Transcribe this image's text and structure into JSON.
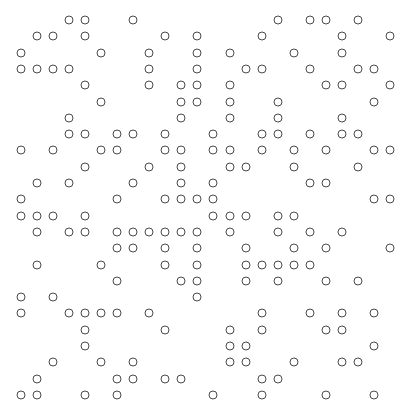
{
  "grid": {
    "columns": 24,
    "rows": 24,
    "origin_x": 21,
    "origin_y": 20,
    "col_pitch": 16.04,
    "row_pitch": 16.3,
    "stroke_color": "#4a4a4a",
    "fill_color": "#ffffff",
    "background": "#ffffff",
    "cells": [
      [
        3,
        4,
        7,
        16,
        18,
        19,
        21
      ],
      [
        1,
        2,
        4,
        9,
        11,
        15,
        20,
        23
      ],
      [
        0,
        5,
        8,
        11,
        13,
        17,
        20
      ],
      [
        0,
        1,
        2,
        3,
        8,
        11,
        14,
        15,
        18,
        21,
        22
      ],
      [
        4,
        8,
        10,
        11,
        13,
        19,
        20,
        23
      ],
      [
        5,
        10,
        11,
        13,
        16,
        22
      ],
      [
        3,
        10,
        13,
        16,
        20
      ],
      [
        3,
        4,
        6,
        7,
        9,
        12,
        15,
        16,
        18,
        20,
        21
      ],
      [
        0,
        2,
        5,
        6,
        9,
        10,
        12,
        13,
        15,
        17,
        19,
        22,
        23
      ],
      [
        4,
        8,
        10,
        13,
        14,
        17,
        21
      ],
      [
        1,
        3,
        7,
        10,
        12,
        18,
        19
      ],
      [
        0,
        6,
        9,
        10,
        11,
        12,
        22,
        23
      ],
      [
        0,
        1,
        2,
        4,
        12,
        13,
        14,
        16,
        17
      ],
      [
        1,
        3,
        4,
        6,
        7,
        8,
        9,
        10,
        11,
        13,
        16,
        18,
        20
      ],
      [
        6,
        7,
        9,
        11,
        14,
        17,
        19,
        23
      ],
      [
        1,
        5,
        9,
        11,
        14,
        15,
        16,
        17,
        18
      ],
      [
        6,
        10,
        11,
        14,
        16,
        19,
        21
      ],
      [
        0,
        2,
        11
      ],
      [
        0,
        3,
        4,
        5,
        6,
        8,
        15,
        18,
        20,
        22
      ],
      [
        4,
        9,
        13,
        15,
        19,
        20
      ],
      [
        4,
        13,
        14,
        22
      ],
      [
        2,
        5,
        7,
        13,
        14,
        17,
        20,
        21
      ],
      [
        1,
        6,
        7,
        9,
        10,
        15,
        16
      ],
      [
        0,
        1,
        4,
        6,
        12,
        15,
        19,
        22
      ]
    ]
  }
}
